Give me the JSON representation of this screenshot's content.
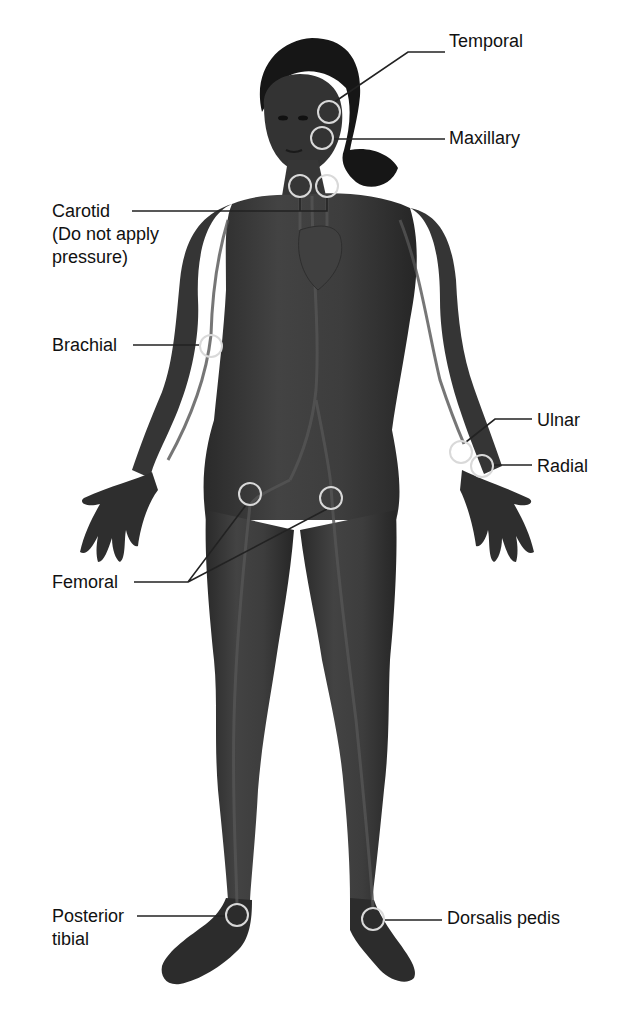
{
  "diagram": {
    "colors": {
      "body": "#3a3a3a",
      "body_dark": "#262626",
      "body_highlight": "#4c4c4c",
      "hair": "#161616",
      "vessel": "#555555",
      "pulse_circle": "#d9d9d9",
      "leader_line": "#222222",
      "leader_line_on_body": "#d0d0d0",
      "text": "#111111",
      "background": "#ffffff"
    },
    "labels": [
      {
        "id": "temporal",
        "text": "Temporal",
        "x": 449,
        "y": 42,
        "align": "left"
      },
      {
        "id": "maxillary",
        "text": "Maxillary",
        "x": 449,
        "y": 127,
        "align": "left"
      },
      {
        "id": "carotid",
        "text": "Carotid\n(Do not apply\npressure)",
        "x": 52,
        "y": 200,
        "align": "left"
      },
      {
        "id": "brachial",
        "text": "Brachial",
        "x": 52,
        "y": 334,
        "align": "left"
      },
      {
        "id": "ulnar",
        "text": "Ulnar",
        "x": 537,
        "y": 409,
        "align": "left"
      },
      {
        "id": "radial",
        "text": "Radial",
        "x": 537,
        "y": 455,
        "align": "left"
      },
      {
        "id": "femoral",
        "text": "Femoral",
        "x": 52,
        "y": 573,
        "align": "left"
      },
      {
        "id": "posterior-tibial",
        "text": "Posterior\ntibial",
        "x": 52,
        "y": 905,
        "align": "left"
      },
      {
        "id": "dorsalis-pedis",
        "text": "Dorsalis pedis",
        "x": 447,
        "y": 905,
        "align": "left"
      }
    ],
    "pulse_points": [
      {
        "id": "temporal",
        "cx": 329,
        "cy": 112,
        "r": 11
      },
      {
        "id": "maxillary",
        "cx": 322,
        "cy": 138,
        "r": 11
      },
      {
        "id": "carotid-left",
        "cx": 300,
        "cy": 186,
        "r": 11
      },
      {
        "id": "carotid-right",
        "cx": 327,
        "cy": 186,
        "r": 11
      },
      {
        "id": "brachial",
        "cx": 211,
        "cy": 346,
        "r": 11
      },
      {
        "id": "ulnar",
        "cx": 461,
        "cy": 452,
        "r": 11
      },
      {
        "id": "radial",
        "cx": 482,
        "cy": 466,
        "r": 11
      },
      {
        "id": "femoral-left",
        "cx": 250,
        "cy": 494,
        "r": 11
      },
      {
        "id": "femoral-right",
        "cx": 331,
        "cy": 498,
        "r": 11
      },
      {
        "id": "posterior-tibial",
        "cx": 237,
        "cy": 915,
        "r": 11
      },
      {
        "id": "dorsalis-pedis",
        "cx": 373,
        "cy": 919,
        "r": 11
      }
    ],
    "leader_lines": [
      {
        "id": "temporal",
        "points": "445,52 408,52 333,103"
      },
      {
        "id": "maxillary",
        "points": "445,139 333,139"
      },
      {
        "id": "carotid",
        "points": "132,211 300,211 300,197 M300,211 327,211 327,197"
      },
      {
        "id": "brachial",
        "points": "133,345 200,345"
      },
      {
        "id": "ulnar",
        "points": "532,419 495,419 466,442"
      },
      {
        "id": "radial",
        "points": "532,465 494,465"
      },
      {
        "id": "femoral",
        "points": "134,582 188,582 246,505 M188,582 327,509"
      },
      {
        "id": "posterior-tibial",
        "points": "137,916 226,916"
      },
      {
        "id": "dorsalis-pedis",
        "points": "442,920 385,920"
      }
    ]
  }
}
